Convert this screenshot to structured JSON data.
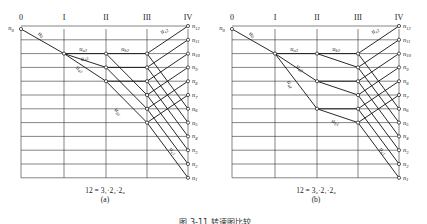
{
  "figure_caption": "图 3-11  转速图比较",
  "panels": [
    {
      "id": "a",
      "shaft_labels": [
        "0",
        "I",
        "II",
        "III",
        "IV"
      ],
      "speed_labels": [
        "n0",
        "n12",
        "n11",
        "n10",
        "n9",
        "n8",
        "n7",
        "n6",
        "n5",
        "n4",
        "n3",
        "n2",
        "n1"
      ],
      "transmission_labels": [
        "u0",
        "ua1",
        "ua2",
        "ua3",
        "ub1",
        "ub2",
        "uc1",
        "uc2"
      ],
      "formula": "12 = 3₁·2₃·2₆",
      "sublabel": "(a)"
    },
    {
      "id": "b",
      "shaft_labels": [
        "0",
        "I",
        "II",
        "III",
        "IV"
      ],
      "speed_labels": [
        "n0",
        "n12",
        "n11",
        "n10",
        "n9",
        "n8",
        "n7",
        "n6",
        "n5",
        "n4",
        "n3",
        "n2",
        "n1"
      ],
      "transmission_labels": [
        "u0",
        "ua1",
        "ua2",
        "ua3",
        "ub1",
        "ub2",
        "uc1",
        "uc2"
      ],
      "formula": "12 = 3₂·2₁·2₆",
      "sublabel": "(b)"
    }
  ]
}
